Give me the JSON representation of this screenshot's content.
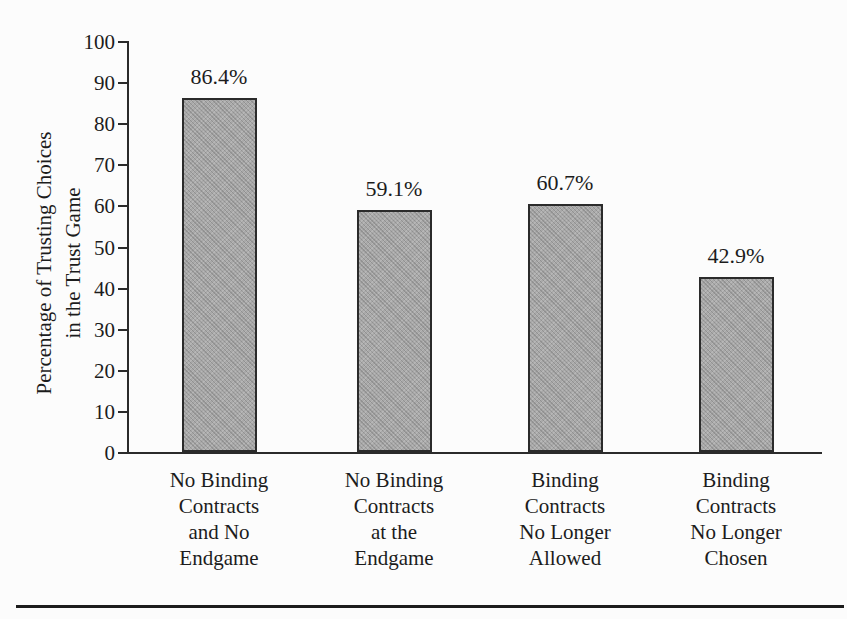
{
  "figure": {
    "colors": {
      "bg": "#fcfcfc",
      "text": "#1c1c1c",
      "axis": "#2b2b2b",
      "bar_fill": "#a9a9a9",
      "bar_border": "#2b2b2b",
      "rule": "#1c1c1c"
    }
  },
  "chart_data": {
    "type": "bar",
    "title": "",
    "ylabel_lines": [
      "Percentage of Trusting Choices",
      "in the Trust Game"
    ],
    "xlabel": "",
    "ylim": [
      0,
      100
    ],
    "yticks": [
      0,
      10,
      20,
      30,
      40,
      50,
      60,
      70,
      80,
      90,
      100
    ],
    "grid": false,
    "legend": "none",
    "categories": [
      [
        "No Binding",
        "Contracts",
        "and No",
        "Endgame"
      ],
      [
        "No Binding",
        "Contracts",
        "at the",
        "Endgame"
      ],
      [
        "Binding",
        "Contracts",
        "No Longer",
        "Allowed"
      ],
      [
        "Binding",
        "Contracts",
        "No Longer",
        "Chosen"
      ]
    ],
    "values": [
      86.4,
      59.1,
      60.7,
      42.9
    ],
    "value_labels": [
      "86.4%",
      "59.1%",
      "60.7%",
      "42.9%"
    ]
  }
}
